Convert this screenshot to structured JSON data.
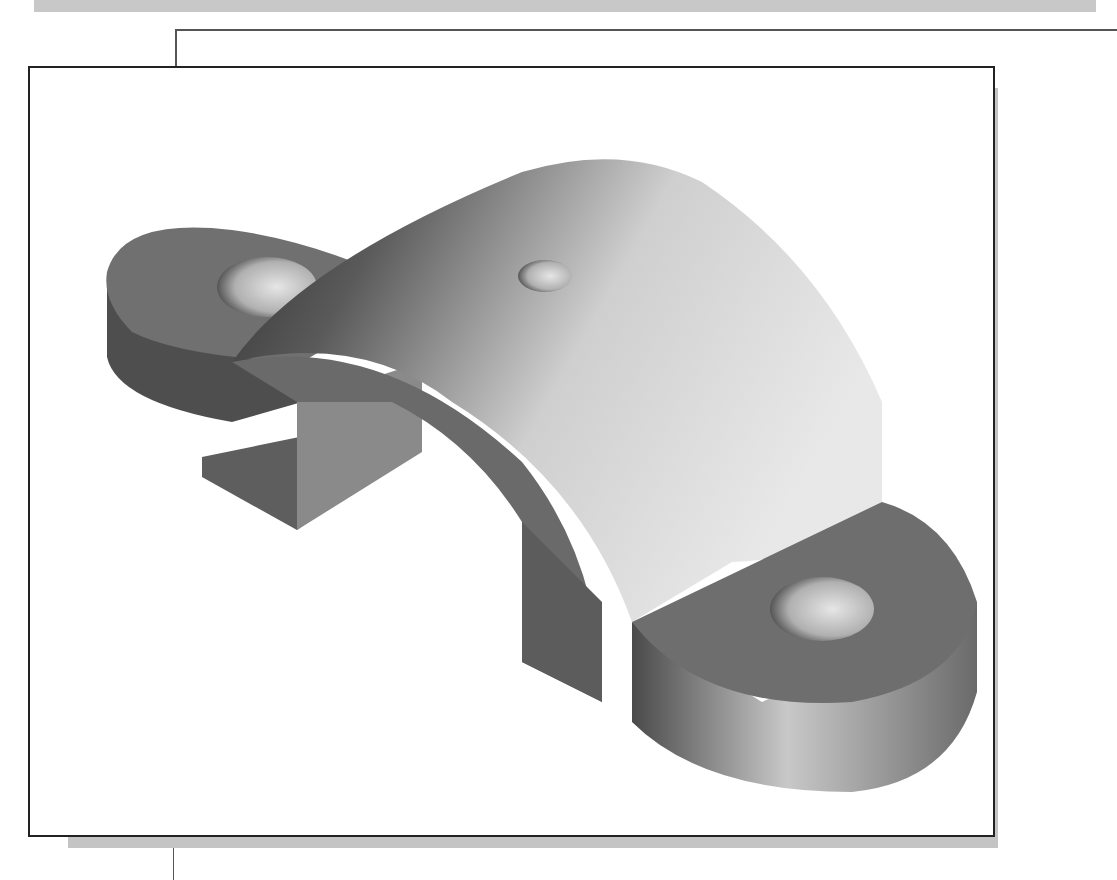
{
  "figure": {
    "features": [
      {
        "name": "left-flange",
        "has_hole": true
      },
      {
        "name": "arched-saddle",
        "has_hole": true
      },
      {
        "name": "right-flange",
        "has_hole": true
      }
    ],
    "colors": {
      "frame_border": "#222222",
      "drop_shadow": "#c4c4c4",
      "flange_top": "#6e6e6e",
      "flange_side": "#5a5a5a",
      "arch_light": "#d8d8d8",
      "arch_dark": "#3c3c3c",
      "hole_inner": "#cfcfcf"
    }
  }
}
